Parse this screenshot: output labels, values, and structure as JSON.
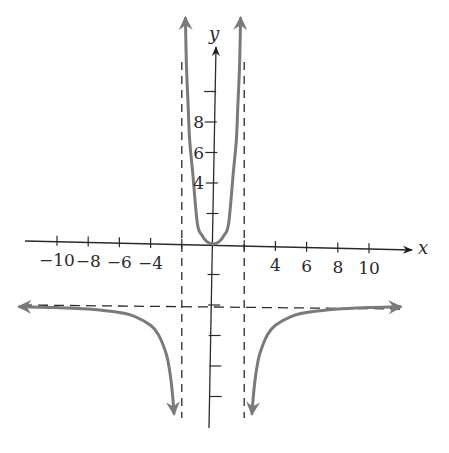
{
  "chart_data": {
    "type": "line",
    "title": "",
    "function": "f(x) = 4x^2 / (4 - x^2)",
    "xlabel": "x",
    "ylabel": "y",
    "xlim": [
      -12.5,
      12.5
    ],
    "ylim": [
      -11.5,
      15
    ],
    "grid": false,
    "x_tick_labels": [
      "-10",
      "-8",
      "-6",
      "-4",
      "4",
      "6",
      "8",
      "10"
    ],
    "x_tick_values": [
      -10,
      -8,
      -6,
      -4,
      -2,
      2,
      4,
      6,
      8,
      10
    ],
    "y_tick_labels": [
      "4",
      "6",
      "8"
    ],
    "y_tick_values": [
      -10,
      -8,
      -6,
      -4,
      -2,
      2,
      4,
      6,
      8,
      10
    ],
    "asymptotes": {
      "vertical": [
        -2,
        2
      ],
      "horizontal": [
        -4
      ]
    },
    "series": [
      {
        "name": "left-branch",
        "x": [
          -12.4,
          -10,
          -8,
          -6,
          -5,
          -4,
          -3.5,
          -3,
          -2.8,
          -2.6,
          -2.5
        ],
        "y": [
          -4.11,
          -4.17,
          -4.27,
          -4.5,
          -4.76,
          -5.33,
          -5.94,
          -7.2,
          -8.17,
          -9.8,
          -11.11
        ]
      },
      {
        "name": "middle-branch",
        "x": [
          -1.77,
          -1.7,
          -1.6,
          -1.5,
          -1.3,
          -1,
          -0.7,
          -0.4,
          0,
          0.4,
          0.7,
          1,
          1.3,
          1.5,
          1.6,
          1.7,
          1.77
        ],
        "y": [
          14.8,
          11.62,
          9.28,
          6.86,
          4.68,
          1.33,
          0.56,
          0.16,
          0,
          0.16,
          0.56,
          1.33,
          4.68,
          6.86,
          9.28,
          11.62,
          14.8
        ]
      },
      {
        "name": "right-branch",
        "x": [
          2.5,
          2.6,
          2.8,
          3,
          3.5,
          4,
          5,
          6,
          8,
          10,
          12
        ],
        "y": [
          -11.11,
          -9.8,
          -8.17,
          -7.2,
          -5.94,
          -5.33,
          -4.76,
          -4.5,
          -4.27,
          -4.17,
          -4.12
        ]
      }
    ],
    "colors": {
      "curve": "#7a7a7a",
      "axis": "#2a2a2a",
      "asymptote": "#2a2a2a"
    }
  }
}
